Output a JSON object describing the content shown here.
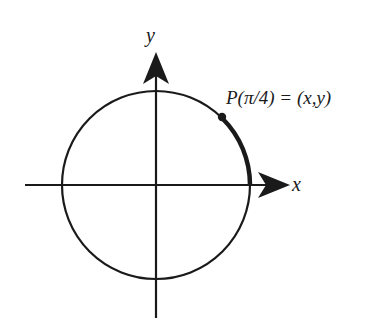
{
  "diagram": {
    "axes": {
      "x_label": "x",
      "y_label": "y"
    },
    "point": {
      "label": "P(π/4) = (x,y)",
      "angle": "π/4"
    },
    "colors": {
      "ink": "#1a1a1a",
      "background": "#ffffff"
    }
  }
}
